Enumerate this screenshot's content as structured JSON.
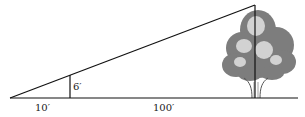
{
  "diagram": {
    "labels": {
      "post_height": "6′",
      "near_distance": "10′",
      "far_distance": "100′"
    },
    "colors": {
      "line": "#111111",
      "foliage_dark": "#7a7a7a",
      "foliage_light": "#d8d8d8"
    }
  }
}
